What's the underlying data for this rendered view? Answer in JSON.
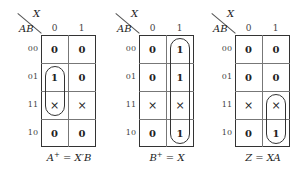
{
  "maps": [
    {
      "id": "A_plus",
      "x_var": "X",
      "row_var": "AB",
      "col_headers": [
        "0",
        "1"
      ],
      "row_headers": [
        "00",
        "01",
        "11",
        "10"
      ],
      "cells": [
        [
          "0",
          "0"
        ],
        [
          "1",
          "0"
        ],
        [
          "×",
          "×"
        ],
        [
          "0",
          "0"
        ]
      ],
      "caption": "A⁺ = X′B",
      "caption_lhs": "A",
      "caption_sup": "+",
      "caption_rhs": " = X′B",
      "loops": [
        {
          "col": 0,
          "row_start": 1,
          "row_end": 2
        }
      ]
    },
    {
      "id": "B_plus",
      "x_var": "X",
      "row_var": "AB",
      "col_headers": [
        "0",
        "1"
      ],
      "row_headers": [
        "00",
        "01",
        "11",
        "10"
      ],
      "cells": [
        [
          "0",
          "1"
        ],
        [
          "0",
          "1"
        ],
        [
          "×",
          "×"
        ],
        [
          "0",
          "1"
        ]
      ],
      "caption": "B⁺ = X",
      "caption_lhs": "B",
      "caption_sup": "+",
      "caption_rhs": " = X",
      "loops": [
        {
          "col": 1,
          "row_start": 0,
          "row_end": 3
        }
      ]
    },
    {
      "id": "Z",
      "x_var": "X",
      "row_var": "AB",
      "col_headers": [
        "0",
        "1"
      ],
      "row_headers": [
        "00",
        "01",
        "11",
        "10"
      ],
      "cells": [
        [
          "0",
          "0"
        ],
        [
          "0",
          "0"
        ],
        [
          "×",
          "×"
        ],
        [
          "0",
          "1"
        ]
      ],
      "caption": "Z = XA",
      "caption_lhs": "Z",
      "caption_sup": "",
      "caption_rhs": " = XA",
      "loops": [
        {
          "col": 1,
          "row_start": 2,
          "row_end": 3
        }
      ]
    }
  ]
}
